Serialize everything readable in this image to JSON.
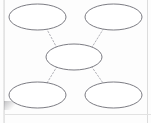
{
  "worksheet": {
    "title": "Concept Map Graphic Organizer",
    "background_color": "#fdfdfd",
    "node_fill_color": "#ffffff",
    "node_stroke_color": "#6d6d75",
    "connector_color": "#a9a9b0",
    "connector_style": "dotted",
    "page_edge_color": "#dcdcdc"
  },
  "nodes": [
    {
      "id": "top-left",
      "label": "",
      "cx": 37.5,
      "cy": 17.0,
      "rx": 28.5,
      "ry": 13.0
    },
    {
      "id": "top-right",
      "label": "",
      "cx": 113.5,
      "cy": 17.0,
      "rx": 28.5,
      "ry": 13.0
    },
    {
      "id": "center",
      "label": "",
      "cx": 74.0,
      "cy": 57.0,
      "rx": 28.0,
      "ry": 13.0
    },
    {
      "id": "bottom-left",
      "label": "",
      "cx": 37.5,
      "cy": 95.0,
      "rx": 28.5,
      "ry": 13.0
    },
    {
      "id": "bottom-right",
      "label": "",
      "cx": 113.5,
      "cy": 95.0,
      "rx": 28.5,
      "ry": 13.0
    }
  ],
  "connectors": [
    {
      "id": "center-to-top-left",
      "from": "center",
      "to": "top-left",
      "x1": 57.0,
      "y1": 48.0,
      "x2": 47.0,
      "y2": 29.5
    },
    {
      "id": "center-to-top-right",
      "from": "center",
      "to": "top-right",
      "x1": 91.5,
      "y1": 48.0,
      "x2": 103.0,
      "y2": 29.5
    },
    {
      "id": "center-to-bottom-left",
      "from": "center",
      "to": "bottom-left",
      "x1": 57.0,
      "y1": 66.5,
      "x2": 47.0,
      "y2": 83.0
    },
    {
      "id": "center-to-bottom-right",
      "from": "center",
      "to": "bottom-right",
      "x1": 91.5,
      "y1": 66.5,
      "x2": 103.0,
      "y2": 83.0
    }
  ]
}
